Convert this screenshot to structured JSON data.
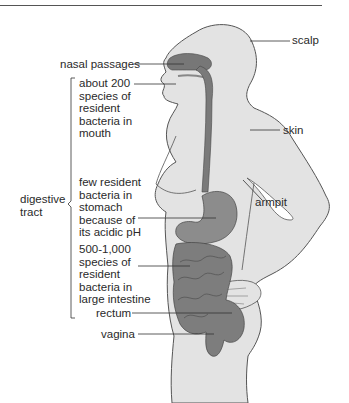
{
  "figure": {
    "colors": {
      "body_fill": "#e3e3e3",
      "body_outline": "#555555",
      "organ_dark": "#6e6e6e",
      "organ_mid": "#9a9a9a",
      "leader_line": "#333333",
      "text": "#2a2a2a"
    }
  },
  "labels": {
    "scalp": "scalp",
    "nasal_passages": "nasal passages",
    "mouth": "about 200\nspecies of\nresident\nbacteria in\nmouth",
    "skin": "skin",
    "armpit": "armpit",
    "digestive_tract": "digestive\ntract",
    "stomach": "few resident\nbacteria in\nstomach\nbecause of\nits acidic pH",
    "large_intestine": "500-1,000\nspecies of\nresident\nbacteria in\nlarge intestine",
    "rectum": "rectum",
    "vagina": "vagina"
  }
}
